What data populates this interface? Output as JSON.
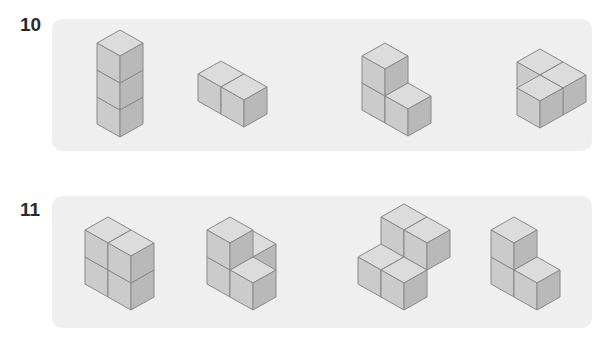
{
  "problems": [
    {
      "number": "10",
      "figures": [
        {
          "id": "a",
          "description": "three cubes stacked vertically"
        },
        {
          "id": "b",
          "description": "two cubes side by side"
        },
        {
          "id": "c",
          "description": "L-shape: two stacked plus one in front-right"
        },
        {
          "id": "d",
          "description": "three cubes flat L-shape"
        }
      ]
    },
    {
      "number": "11",
      "figures": [
        {
          "id": "a",
          "description": "2x2 wall of four cubes"
        },
        {
          "id": "b",
          "description": "four cubes stepped"
        },
        {
          "id": "c",
          "description": "four cubes staggered block"
        },
        {
          "id": "d",
          "description": "three cubes L-shape"
        }
      ]
    }
  ],
  "colors": {
    "panel": "#efefef",
    "top": "#dcdcdc",
    "left": "#cbcbcb",
    "right": "#b9b9b9",
    "edge": "#8a8a8a"
  }
}
